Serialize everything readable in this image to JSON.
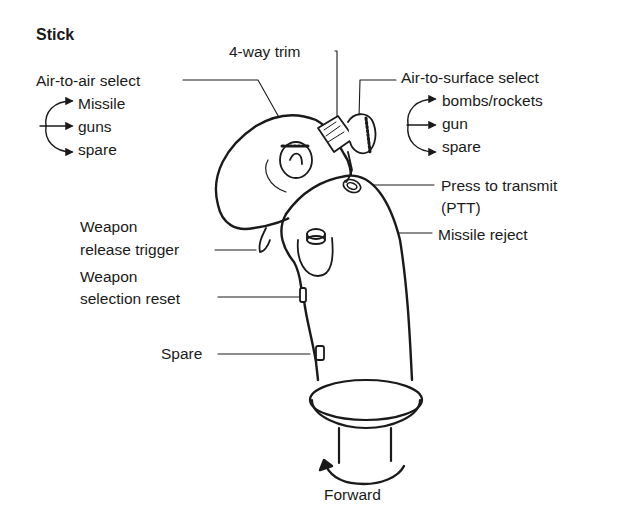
{
  "title": "Stick",
  "labels": {
    "four_way_trim": "4-way trim",
    "air_to_air": {
      "heading": "Air-to-air select",
      "options": [
        "Missile",
        "guns",
        "spare"
      ]
    },
    "air_to_surface": {
      "heading": "Air-to-surface select",
      "options": [
        "bombs/rockets",
        "gun",
        "spare"
      ]
    },
    "ptt": {
      "line1": "Press to transmit",
      "line2": "(PTT)"
    },
    "missile_reject": "Missile reject",
    "weapon_release": {
      "line1": "Weapon",
      "line2": "release trigger"
    },
    "weapon_selection_reset": {
      "line1": "Weapon",
      "line2": "selection reset"
    },
    "spare": "Spare",
    "forward": "Forward"
  },
  "colors": {
    "ink": "#1a1a1a",
    "background": "#ffffff"
  }
}
